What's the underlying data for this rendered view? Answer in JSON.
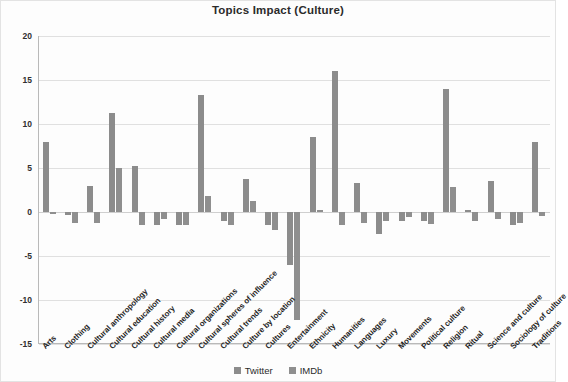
{
  "chart_data": {
    "type": "bar",
    "title": "Topics Impact (Culture)",
    "xlabel": "",
    "ylabel": "",
    "ylim": [
      -15,
      20
    ],
    "yticks": [
      20,
      15,
      10,
      5,
      0,
      -5,
      -10,
      -15
    ],
    "ytick_labels": [
      "20",
      "15",
      "10",
      "5",
      "0",
      "-5",
      "-10",
      "-15"
    ],
    "grid": true,
    "legend_position": "bottom",
    "categories": [
      "Arts",
      "Clothing",
      "Cultural anthropology",
      "Cultural education",
      "Cultural history",
      "Cultural media",
      "Cultural organizations",
      "Cultural spheres of influence",
      "Cultural trends",
      "Culture by location",
      "Cultures",
      "Entertainment",
      "Ethnicity",
      "Humanities",
      "Languages",
      "Luxury",
      "Movements",
      "Political culture",
      "Religion",
      "Ritual",
      "Science and culture",
      "Sociology of culture",
      "Traditions"
    ],
    "series": [
      {
        "name": "Twitter",
        "color": "#8c8c8c",
        "values": [
          8.0,
          -0.3,
          3.0,
          11.2,
          5.2,
          -1.5,
          -1.5,
          13.3,
          -1.0,
          3.8,
          -1.5,
          -6.0,
          8.5,
          16.0,
          3.3,
          -2.5,
          -1.0,
          -1.0,
          14.0,
          0.2,
          3.5,
          -1.5,
          8.0
        ]
      },
      {
        "name": "IMDb",
        "color": "#8f8f8f",
        "values": [
          -0.2,
          -1.2,
          -1.3,
          5.0,
          -1.5,
          -0.8,
          -1.5,
          1.8,
          -1.5,
          1.2,
          -2.0,
          -12.3,
          0.2,
          -1.5,
          -1.3,
          -1.0,
          -0.6,
          -1.4,
          2.8,
          -1.0,
          -0.8,
          -1.2,
          -0.5
        ]
      }
    ]
  },
  "legend": {
    "items": [
      {
        "label": "Twitter",
        "color": "#8c8c8c"
      },
      {
        "label": "IMDb",
        "color": "#8f8f8f"
      }
    ]
  }
}
